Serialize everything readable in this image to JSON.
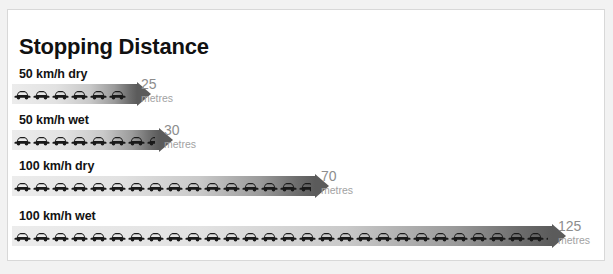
{
  "title": "Stopping Distance",
  "unit_label": "metres",
  "colors": {
    "page_background": "#f2f2f2",
    "card_background": "#ffffff",
    "card_border": "#d8d8d8",
    "title_text": "#111111",
    "row_label_text": "#131313",
    "value_text": "#8d8d8d",
    "unit_text": "#a2a2a2",
    "bar_gradient_start": "#ececec",
    "bar_gradient_end": "#5b5b5b",
    "car_icon": "#1a1a1a"
  },
  "chart_data": {
    "type": "bar",
    "title": "Stopping Distance",
    "xlabel": "",
    "ylabel": "",
    "orientation": "horizontal",
    "grid": false,
    "legend": "none",
    "unit": "metres",
    "categories": [
      "50 km/h  dry",
      "50 km/h  wet",
      "100 km/h  dry",
      "100 km/h  wet"
    ],
    "values": [
      25,
      30,
      70,
      125
    ],
    "xlim": [
      0,
      125
    ],
    "bars": [
      {
        "label": "50 km/h  dry",
        "speed": "50 km/h",
        "condition": "dry",
        "value": 25,
        "value_text": "25",
        "unit": "metres",
        "car_count": 6,
        "bar_width_px": 125,
        "row_top_px": 57,
        "value_left_px": 133
      },
      {
        "label": "50 km/h  wet",
        "speed": "50 km/h",
        "condition": "wet",
        "value": 30,
        "value_text": "30",
        "unit": "metres",
        "car_count": 8,
        "bar_width_px": 147,
        "row_top_px": 103,
        "value_left_px": 156
      },
      {
        "label": "100 km/h  dry",
        "speed": "100 km/h",
        "condition": "dry",
        "value": 70,
        "value_text": "70",
        "unit": "metres",
        "car_count": 18,
        "bar_width_px": 303,
        "row_top_px": 149,
        "value_left_px": 313
      },
      {
        "label": "100 km/h  wet",
        "speed": "100 km/h",
        "condition": "wet",
        "value": 125,
        "value_text": "125",
        "unit": "metres",
        "car_count": 31,
        "bar_width_px": 540,
        "row_top_px": 199,
        "value_left_px": 550
      }
    ]
  },
  "icons": {
    "car": "car-icon",
    "arrow": "arrow-head-icon"
  }
}
